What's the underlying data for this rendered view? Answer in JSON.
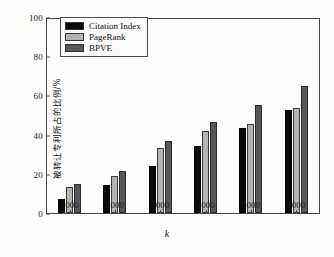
{
  "chart_data": {
    "type": "bar",
    "title": "",
    "xlabel": "k",
    "ylabel": "被转让专利所占的比例/%",
    "categories": [
      "1000",
      "2000",
      "3000",
      "4000",
      "5000",
      "6000"
    ],
    "series": [
      {
        "name": "Citation Index",
        "color": "#0a0a0a",
        "values": [
          7,
          14.5,
          24,
          34,
          43.5,
          52.5
        ]
      },
      {
        "name": "PageRank",
        "color": "#b4b4b4",
        "values": [
          13.5,
          19,
          33,
          42,
          45.5,
          53.5
        ]
      },
      {
        "name": "BPVE",
        "color": "#585858",
        "values": [
          15,
          21.5,
          36.5,
          46.5,
          55,
          65
        ]
      }
    ],
    "ylim": [
      0,
      100
    ],
    "yticks": [
      "0",
      "20",
      "40",
      "60",
      "80",
      "100"
    ],
    "grid": false,
    "legend_position": "top-left"
  },
  "caption": {
    "text": ""
  }
}
